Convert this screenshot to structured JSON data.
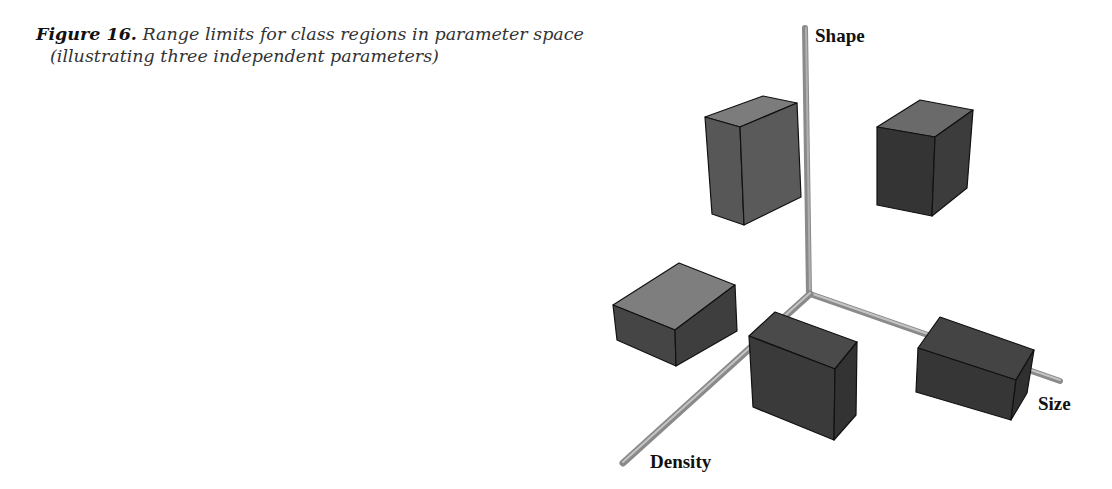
{
  "caption": {
    "figure_number": "Figure 16.",
    "text_line1": "Range limits for class regions in parameter space",
    "text_line2": "(illustrating three independent parameters)"
  },
  "axes": {
    "vertical": {
      "label": "Shape"
    },
    "right": {
      "label": "Size"
    },
    "front": {
      "label": "Density"
    }
  },
  "colors": {
    "axis": "#9a9a9a",
    "axis_highlight": "#c4c4c4",
    "box_top_light": "#7c7c7c",
    "box_side_mid": "#525252",
    "box_side_dark": "#333333",
    "edge": "#111111"
  },
  "boxes": [
    {
      "name": "class-region-upper-left",
      "position": "upper-left, behind Shape axis"
    },
    {
      "name": "class-region-upper-right",
      "position": "upper-right"
    },
    {
      "name": "class-region-lower-left",
      "position": "lower-left"
    },
    {
      "name": "class-region-front",
      "position": "front, near Density axis"
    },
    {
      "name": "class-region-on-size-axis",
      "position": "on Size axis"
    }
  ]
}
